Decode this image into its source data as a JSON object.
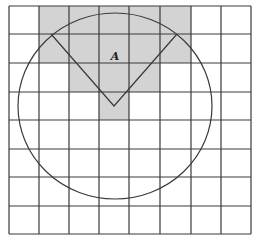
{
  "diagram": {
    "type": "grid-with-circle-sector",
    "grid": {
      "columns": 8,
      "rows": 8,
      "x_lines": [
        9,
        39,
        69,
        99,
        129,
        160,
        191,
        221,
        251
      ],
      "y_lines": [
        6,
        34,
        63,
        92,
        120,
        149,
        177,
        206,
        234
      ],
      "line_color": "#3a3a3a"
    },
    "shaded_cells": [
      {
        "row": 0,
        "cols": [
          1,
          2,
          3,
          4,
          5
        ]
      },
      {
        "row": 1,
        "cols": [
          1,
          2,
          3,
          4,
          5
        ]
      },
      {
        "row": 2,
        "cols": [
          2,
          3,
          4
        ]
      },
      {
        "row": 3,
        "cols": [
          3
        ]
      }
    ],
    "shade_color": "#d3d3d3",
    "circle": {
      "cx": 115,
      "cy": 106,
      "rx": 97,
      "ry": 93,
      "stroke": "#3a3a3a"
    },
    "sector": {
      "vertex": [
        114,
        106
      ],
      "left_end": [
        51,
        34
      ],
      "right_end": [
        177,
        34
      ]
    },
    "label": {
      "text": "A",
      "x": 115,
      "y": 60
    }
  }
}
